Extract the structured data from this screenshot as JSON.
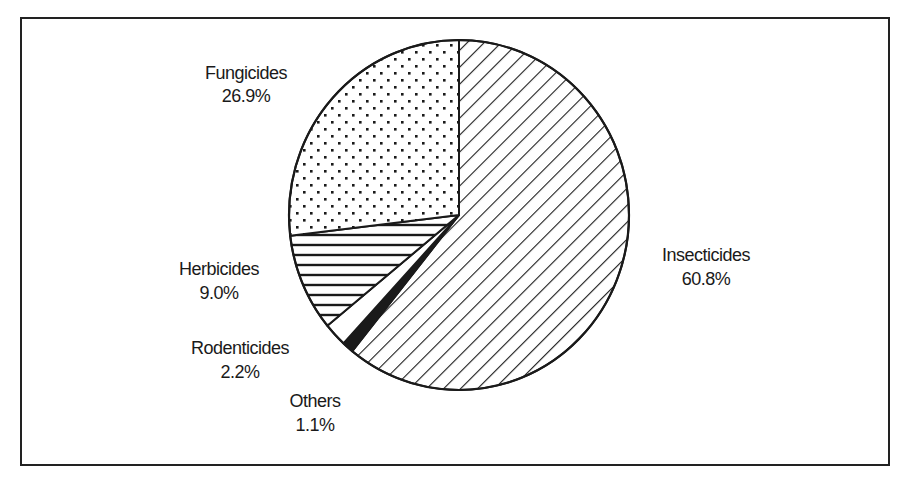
{
  "chart_data": {
    "type": "pie",
    "title": "",
    "start_angle": "12 o'clock",
    "direction": "clockwise",
    "slices": [
      {
        "label": "Insecticides",
        "value": 60.8,
        "value_label": "60.8%",
        "fill": "diagonal-hatch"
      },
      {
        "label": "Others",
        "value": 1.1,
        "value_label": "1.1%",
        "fill": "solid-black"
      },
      {
        "label": "Rodenticides",
        "value": 2.2,
        "value_label": "2.2%",
        "fill": "white"
      },
      {
        "label": "Herbicides",
        "value": 9.0,
        "value_label": "9.0%",
        "fill": "horizontal-hatch"
      },
      {
        "label": "Fungicides",
        "value": 26.9,
        "value_label": "26.9%",
        "fill": "dots"
      }
    ],
    "legend": "none",
    "colors": {
      "ink": "#1a1a1a",
      "background": "#ffffff"
    }
  }
}
